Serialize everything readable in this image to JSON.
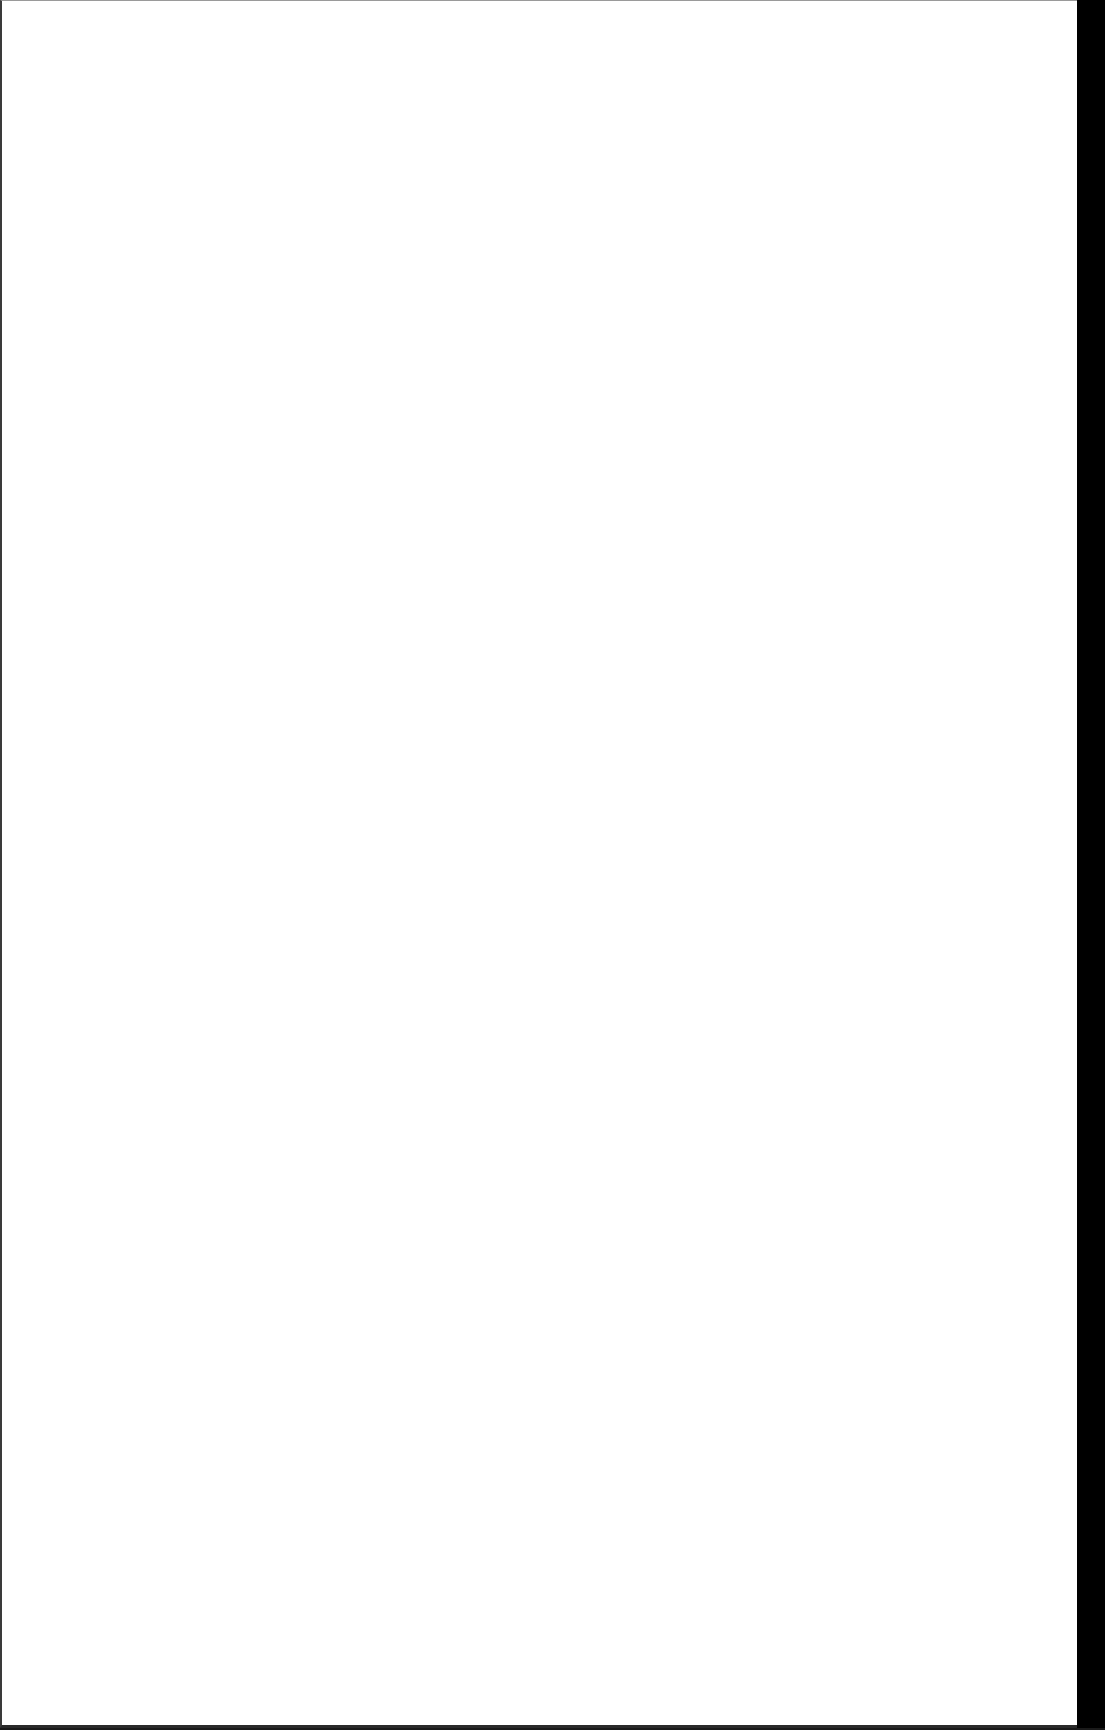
{
  "document": {
    "content": "",
    "page_background": "#ffffff",
    "edge_color": "#000000"
  }
}
